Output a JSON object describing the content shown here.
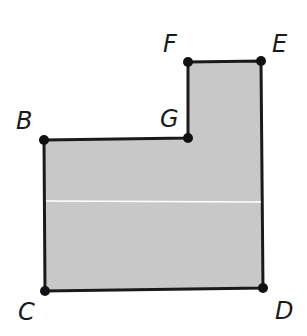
{
  "diagram": {
    "type": "polygon-figure",
    "fill_color": "#c8c8c8",
    "stroke_color": "#1a1a1a",
    "vertices": [
      {
        "name": "B",
        "x": 44,
        "y": 140
      },
      {
        "name": "G",
        "x": 188,
        "y": 138
      },
      {
        "name": "F",
        "x": 188,
        "y": 62
      },
      {
        "name": "E",
        "x": 261,
        "y": 61
      },
      {
        "name": "D",
        "x": 263,
        "y": 288
      },
      {
        "name": "C",
        "x": 45,
        "y": 291
      }
    ],
    "labels": {
      "B": "B",
      "G": "G",
      "F": "F",
      "E": "E",
      "C": "C",
      "D": "D"
    },
    "divider_line_y": 201
  }
}
